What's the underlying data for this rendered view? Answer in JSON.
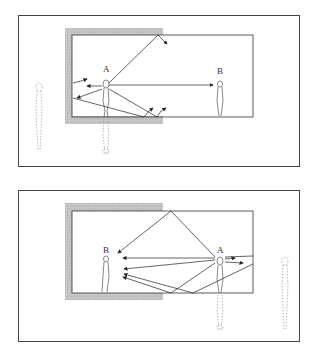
{
  "diagrams": [
    {
      "id": "top",
      "description": "Speaker A near absorptive (shaded) wall corner; direct sound to listener B, reflections from walls",
      "labels": {
        "speaker": "A",
        "listener": "B"
      }
    },
    {
      "id": "bottom",
      "description": "Speaker A near reflective right wall; listener B near shaded corner receives direct and multiple reflected paths",
      "labels": {
        "speaker": "A",
        "listener": "B"
      }
    }
  ],
  "colors": {
    "line": "#333333",
    "shade": "#bbbbbb",
    "border": "#444444",
    "ghost": "#999999"
  }
}
